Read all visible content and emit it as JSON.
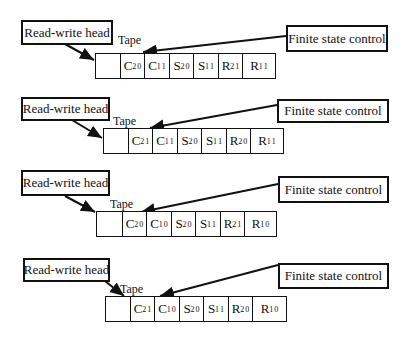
{
  "diagram": {
    "type": "turing-machine-tape-sequence",
    "labels": {
      "read_write_head": "Read-write head",
      "finite_state_control": "Finite state control",
      "tape": "Tape"
    },
    "rows": [
      {
        "step": 1,
        "cells": [
          {
            "sym": "",
            "sub": "",
            "sup": ""
          },
          {
            "sym": "C",
            "sub": "2",
            "sup": "0"
          },
          {
            "sym": "C",
            "sub": "1",
            "sup": "1"
          },
          {
            "sym": "S",
            "sub": "2",
            "sup": "0"
          },
          {
            "sym": "S",
            "sub": "1",
            "sup": "1"
          },
          {
            "sym": "R",
            "sub": "2",
            "sup": "1"
          },
          {
            "sym": "R",
            "sub": "1",
            "sup": "1"
          }
        ]
      },
      {
        "step": 2,
        "cells": [
          {
            "sym": "",
            "sub": "",
            "sup": ""
          },
          {
            "sym": "C",
            "sub": "2",
            "sup": "1"
          },
          {
            "sym": "C",
            "sub": "1",
            "sup": "1"
          },
          {
            "sym": "S",
            "sub": "2",
            "sup": "0"
          },
          {
            "sym": "S",
            "sub": "1",
            "sup": "1"
          },
          {
            "sym": "R",
            "sub": "2",
            "sup": "0"
          },
          {
            "sym": "R",
            "sub": "1",
            "sup": "1"
          }
        ]
      },
      {
        "step": 3,
        "cells": [
          {
            "sym": "",
            "sub": "",
            "sup": ""
          },
          {
            "sym": "C",
            "sub": "2",
            "sup": "0"
          },
          {
            "sym": "C",
            "sub": "1",
            "sup": "0"
          },
          {
            "sym": "S",
            "sub": "2",
            "sup": "0"
          },
          {
            "sym": "S",
            "sub": "1",
            "sup": "1"
          },
          {
            "sym": "R",
            "sub": "2",
            "sup": "1"
          },
          {
            "sym": "R",
            "sub": "1",
            "sup": "0"
          }
        ]
      },
      {
        "step": 4,
        "cells": [
          {
            "sym": "",
            "sub": "",
            "sup": ""
          },
          {
            "sym": "C",
            "sub": "2",
            "sup": "1"
          },
          {
            "sym": "C",
            "sub": "1",
            "sup": "0"
          },
          {
            "sym": "S",
            "sub": "2",
            "sup": "0"
          },
          {
            "sym": "S",
            "sub": "1",
            "sup": "1"
          },
          {
            "sym": "R",
            "sub": "2",
            "sup": "0"
          },
          {
            "sym": "R",
            "sub": "1",
            "sup": "0"
          }
        ]
      }
    ]
  }
}
